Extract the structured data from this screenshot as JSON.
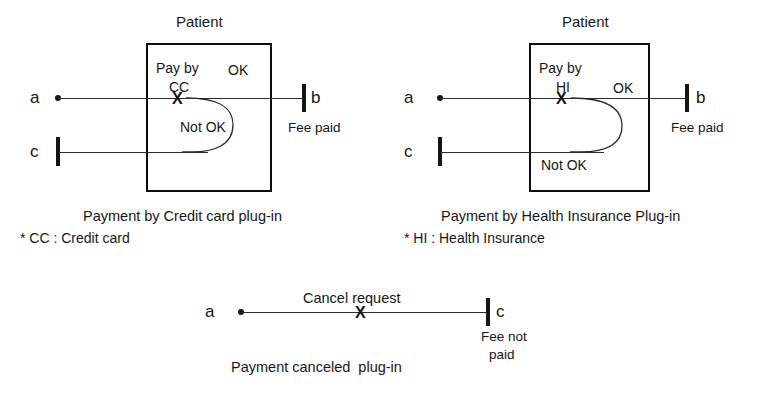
{
  "figure": {
    "stroke_color": "#141414",
    "background_color": "#ffffff"
  },
  "diagrams": [
    {
      "id": "credit-card",
      "frame_label": "Patient",
      "caption": "Payment by Credit card plug-in",
      "footnote": "* CC : Credit card",
      "lifelines": [
        {
          "name": "a",
          "label": "a",
          "terminal": "dot"
        },
        {
          "name": "b",
          "label": "b",
          "terminal": "bar",
          "note": "Fee paid"
        },
        {
          "name": "c",
          "label": "c",
          "terminal": "bar"
        }
      ],
      "actions": [
        {
          "name": "pay-by",
          "label": "Pay by",
          "mark": "X"
        },
        {
          "name": "method",
          "label": "CC"
        },
        {
          "name": "ok-branch",
          "label": "OK"
        },
        {
          "name": "not-ok-branch",
          "label": "Not OK"
        }
      ]
    },
    {
      "id": "health-insurance",
      "frame_label": "Patient",
      "caption": "Payment by Health Insurance Plug-in",
      "footnote": "* HI : Health Insurance",
      "lifelines": [
        {
          "name": "a",
          "label": "a",
          "terminal": "dot"
        },
        {
          "name": "b",
          "label": "b",
          "terminal": "bar",
          "note": "Fee paid"
        },
        {
          "name": "c",
          "label": "c",
          "terminal": "bar"
        }
      ],
      "actions": [
        {
          "name": "pay-by",
          "label": "Pay by",
          "mark": "X"
        },
        {
          "name": "method",
          "label": "HI"
        },
        {
          "name": "ok-branch",
          "label": "OK"
        },
        {
          "name": "not-ok-branch",
          "label": "Not OK"
        }
      ]
    },
    {
      "id": "cancel",
      "caption": "Payment canceled  plug-in",
      "lifelines": [
        {
          "name": "a",
          "label": "a",
          "terminal": "dot"
        },
        {
          "name": "c",
          "label": "c",
          "terminal": "bar",
          "note_line1": "Fee not",
          "note_line2": "paid"
        }
      ],
      "actions": [
        {
          "name": "cancel-request",
          "label": "Cancel request",
          "mark": "X"
        }
      ]
    }
  ]
}
